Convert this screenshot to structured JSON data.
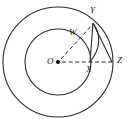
{
  "figure": {
    "kind": "geometry-diagram",
    "background_color": "#ffffff",
    "stroke_color": "#2b2b2b",
    "label_color": "#1a1a1a",
    "canvas": {
      "width": 130,
      "height": 119
    }
  },
  "geometry": {
    "center": {
      "name": "O",
      "x": 58,
      "y": 62
    },
    "circles": [
      {
        "name": "inner-circle",
        "cx": 58,
        "cy": 62,
        "r": 33,
        "style": "solid"
      },
      {
        "name": "outer-circle",
        "cx": 58,
        "cy": 62,
        "r": 55,
        "style": "solid"
      }
    ],
    "points": [
      {
        "name": "O",
        "label": "O",
        "x": 58,
        "y": 62,
        "on": "center",
        "dot": true
      },
      {
        "name": "W",
        "label": "W",
        "x": 80,
        "y": 38,
        "on": "inner-circle",
        "dot": false
      },
      {
        "name": "X",
        "label": "X",
        "x": 91,
        "y": 62,
        "on": "inner-circle",
        "dot": false
      },
      {
        "name": "Y",
        "label": "Y",
        "x": 95,
        "y": 21,
        "on": "outer-circle",
        "dot": false
      },
      {
        "name": "Z",
        "label": "Z",
        "x": 113,
        "y": 62,
        "on": "outer-circle",
        "dot": false
      }
    ],
    "segments": [
      {
        "name": "segment-O-Z",
        "from": "O",
        "to": "Z",
        "style": "dashed",
        "passes_through": "X"
      },
      {
        "name": "segment-O-Y",
        "from": "O",
        "to": "Y",
        "style": "dashed",
        "passes_through": "W"
      },
      {
        "name": "segment-Y-Z",
        "from": "Y",
        "to": "Z",
        "style": "solid"
      },
      {
        "name": "segment-Y-X",
        "from": "Y",
        "to": "X",
        "style": "solid"
      }
    ],
    "arcs": [
      {
        "name": "arc-Y-X",
        "from": "Y",
        "to": "X",
        "style": "solid",
        "bulge": "right"
      }
    ],
    "labels": {
      "O": "O",
      "W": "W",
      "X": "X",
      "Y": "Y",
      "Z": "Z"
    },
    "label_positions": {
      "O": {
        "left": 47,
        "top": 57
      },
      "W": {
        "left": 69,
        "top": 28
      },
      "X": {
        "left": 86,
        "top": 65
      },
      "Y": {
        "left": 90,
        "top": 6
      },
      "Z": {
        "left": 117,
        "top": 56
      }
    }
  }
}
